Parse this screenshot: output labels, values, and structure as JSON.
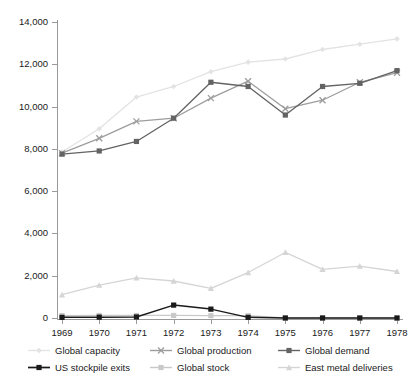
{
  "chart_data": {
    "type": "line",
    "title": "",
    "subtitle": "",
    "xlabel": "",
    "ylabel": "",
    "x": [
      1969,
      1970,
      1971,
      1972,
      1973,
      1974,
      1975,
      1976,
      1977,
      1978
    ],
    "categories": [
      "1969",
      "1970",
      "1971",
      "1972",
      "1973",
      "1974",
      "1975",
      "1976",
      "1977",
      "1978"
    ],
    "ylim": [
      0,
      14000
    ],
    "yticks": [
      0,
      2000,
      4000,
      6000,
      8000,
      10000,
      12000,
      14000
    ],
    "ytick_labels": [
      "0",
      "2,000",
      "4,000",
      "6,000",
      "8,000",
      "10,000",
      "12,000",
      "14,000"
    ],
    "grid": false,
    "legend_position": "bottom",
    "legend_columns": 3,
    "series": [
      {
        "name": "Global capacity",
        "color": "#e3e3e3",
        "marker": "diamond",
        "values": [
          7850,
          8950,
          10450,
          10950,
          11650,
          12100,
          12250,
          12700,
          12950,
          13200
        ]
      },
      {
        "name": "Global production",
        "color": "#9d9d9d",
        "marker": "cross",
        "values": [
          7800,
          8500,
          9300,
          9450,
          10400,
          11200,
          9900,
          10300,
          11150,
          11600
        ]
      },
      {
        "name": "Global demand",
        "color": "#636363",
        "marker": "square",
        "values": [
          7750,
          7900,
          8350,
          9450,
          11150,
          10950,
          9600,
          10950,
          11100,
          11700
        ]
      },
      {
        "name": "US stockpile exits",
        "color": "#1a1a1a",
        "marker": "square",
        "values": [
          30,
          40,
          50,
          610,
          420,
          30,
          0,
          0,
          0,
          0
        ]
      },
      {
        "name": "Global stock",
        "color": "#c9c9c9",
        "marker": "square",
        "values": [
          110,
          120,
          120,
          120,
          110,
          110,
          0,
          0,
          0,
          0
        ]
      },
      {
        "name": "East metal deliveries",
        "color": "#d5d5d5",
        "marker": "triangle",
        "values": [
          1100,
          1550,
          1900,
          1750,
          1400,
          2150,
          3100,
          2300,
          2450,
          2200
        ]
      }
    ]
  },
  "legend": {
    "items": [
      {
        "label": "Global capacity"
      },
      {
        "label": "Global production"
      },
      {
        "label": "Global demand"
      },
      {
        "label": "US stockpile exits"
      },
      {
        "label": "Global stock"
      },
      {
        "label": "East metal deliveries"
      }
    ]
  }
}
